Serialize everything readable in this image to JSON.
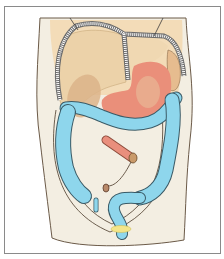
{
  "figure": {
    "colors": {
      "frame_border": "#8a8a8a",
      "background": "#ffffff",
      "torso_skin": "#f2ecdd",
      "torso_outline": "#5a4a3a",
      "diaphragm_fill": "#f0d9b5",
      "rib_band": "#ffffff",
      "liver": "#ecd4ae",
      "gallbladder": "#d9b48a",
      "stomach": "#ea8f7a",
      "spleen": "#e8bf93",
      "colon": "#8ed6ec",
      "colon_outline": "#3a5a66",
      "small_intestine_end": "#e98f7d",
      "appendix": "#b98a6a",
      "bladder": "#f3e58a"
    },
    "organs": [
      {
        "name": "diaphragm"
      },
      {
        "name": "liver"
      },
      {
        "name": "gallbladder"
      },
      {
        "name": "stomach"
      },
      {
        "name": "spleen"
      },
      {
        "name": "transverse-colon"
      },
      {
        "name": "ascending-colon"
      },
      {
        "name": "descending-colon"
      },
      {
        "name": "sigmoid-colon"
      },
      {
        "name": "small-intestine-end"
      },
      {
        "name": "appendix"
      },
      {
        "name": "bladder"
      }
    ]
  }
}
